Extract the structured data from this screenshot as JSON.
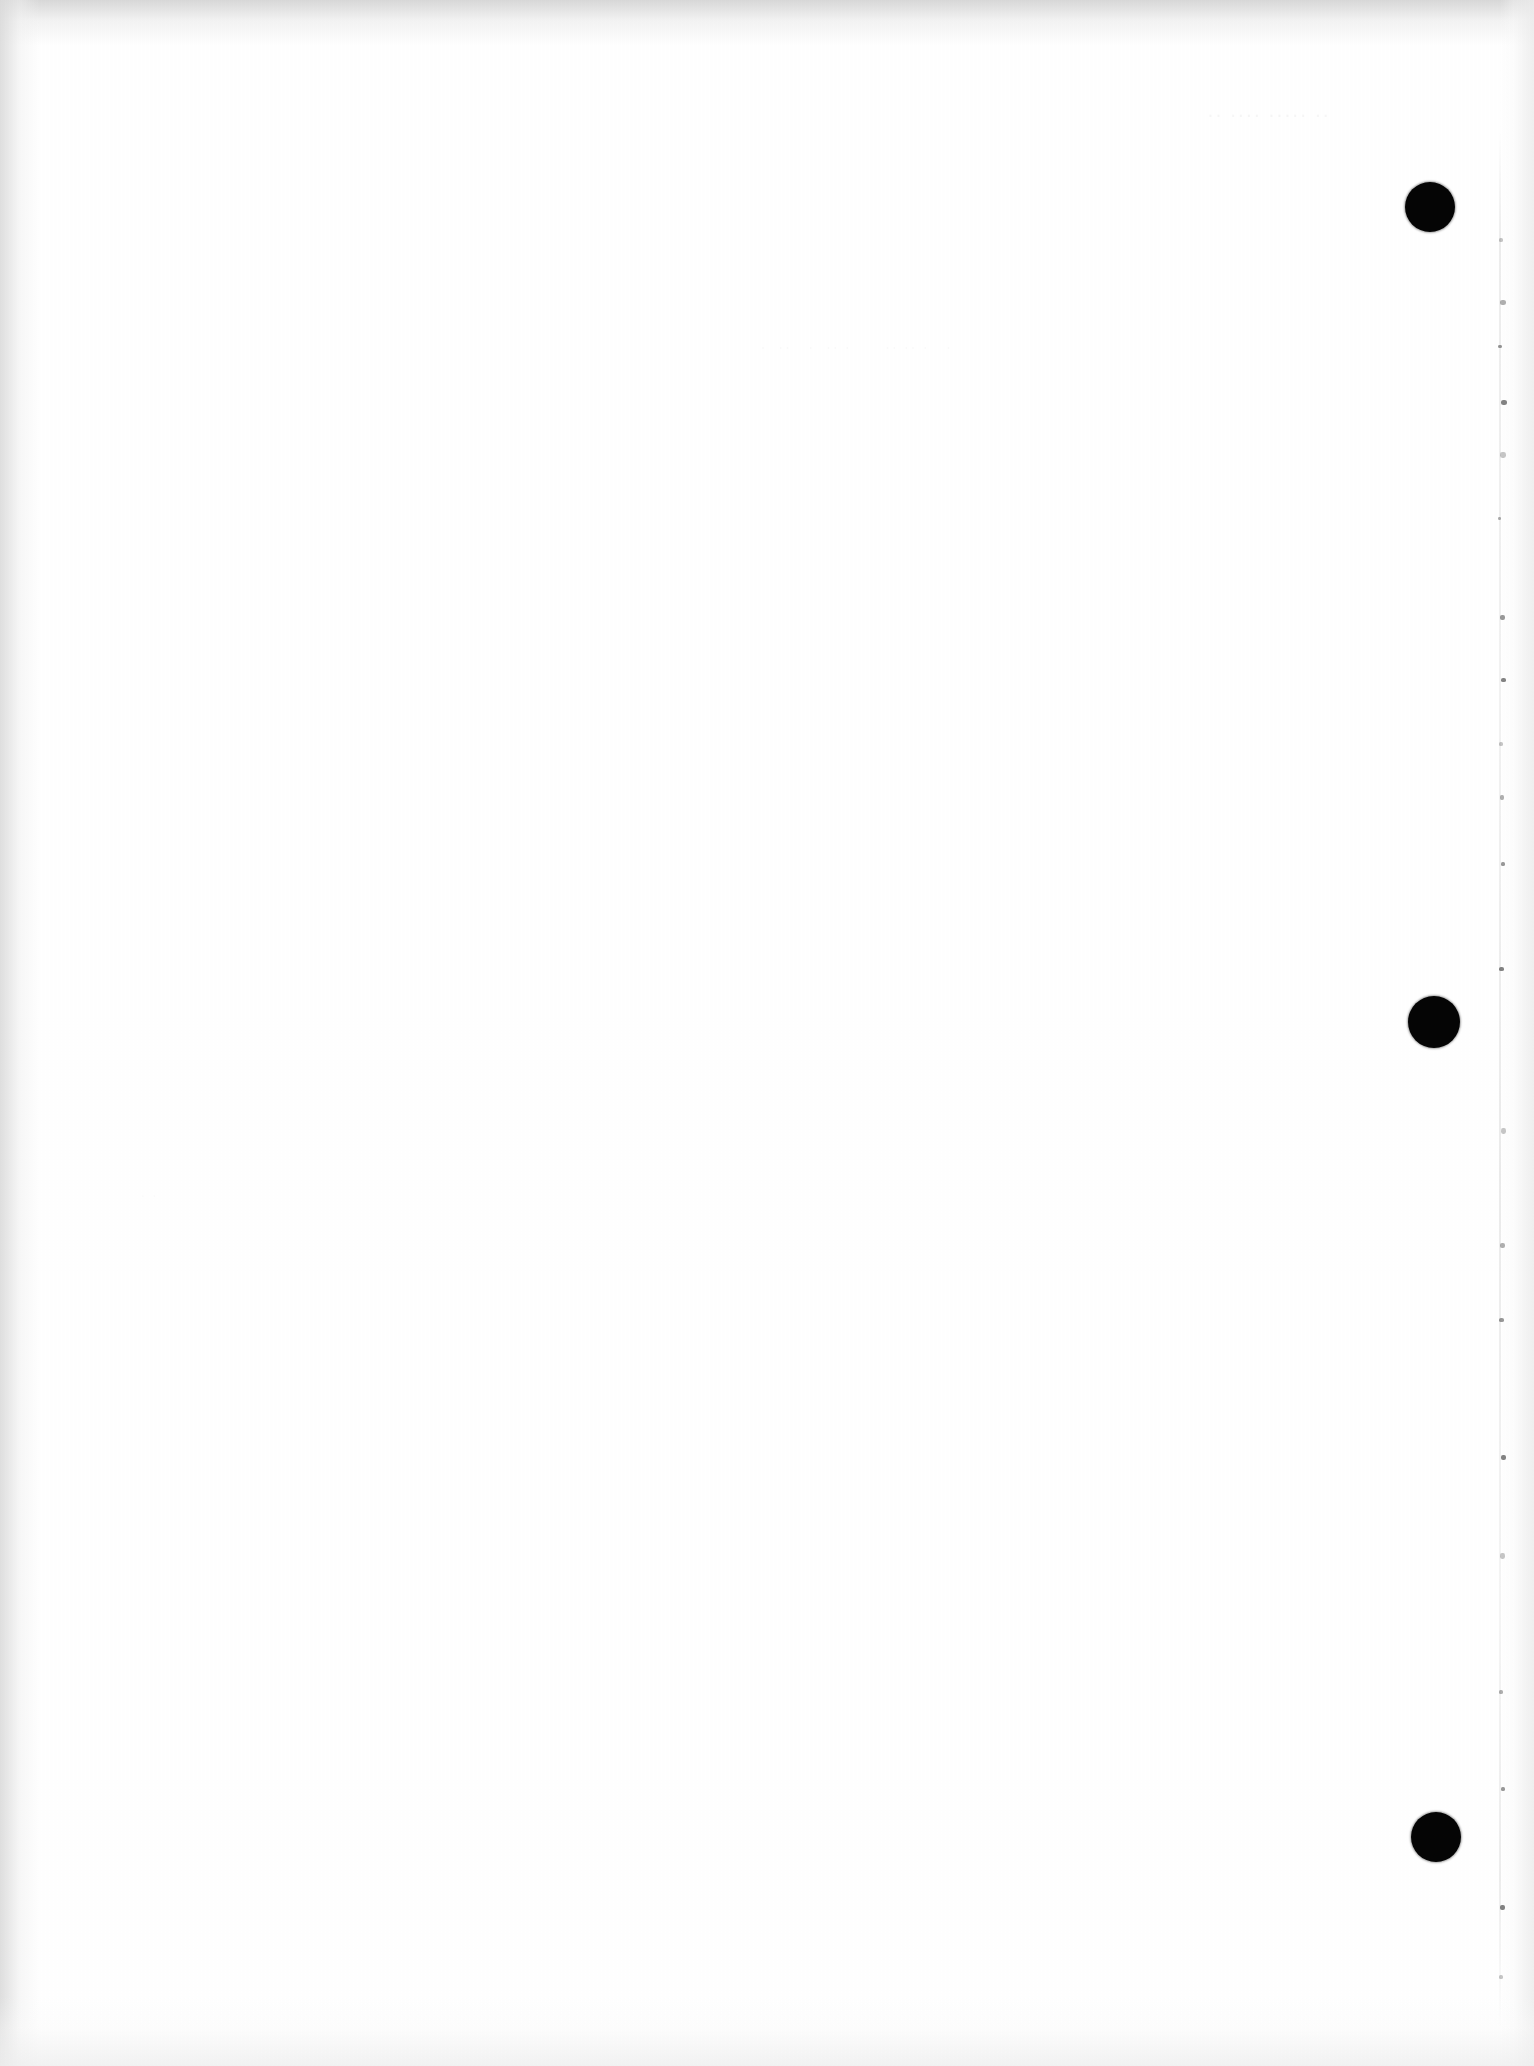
{
  "document": {
    "kind": "scanned-page",
    "orientation": "portrait",
    "page_state": "blank",
    "description": "Blank scanned document page with black registration punch marks along the right margin",
    "width_px": 1534,
    "height_px": 2066
  },
  "colors": {
    "page_background": "#ffffff",
    "scan_frame": "#171717",
    "punch_mark": "#050505",
    "edge_shade": "#ededed",
    "scan_line": "#5c5c5c",
    "ghost_text": "#000000"
  },
  "page": {
    "body_text": "",
    "visible_text": "",
    "note": "No legible printed text is present on this page."
  },
  "punch_marks": [
    {
      "id": "punch-mark-1",
      "label": "registration-dot-top",
      "x": 1430,
      "y": 207,
      "diameter": 50
    },
    {
      "id": "punch-mark-2",
      "label": "registration-dot-middle",
      "x": 1434,
      "y": 1022,
      "diameter": 52
    },
    {
      "id": "punch-mark-3",
      "label": "registration-dot-bottom",
      "x": 1436,
      "y": 1837,
      "diameter": 50
    }
  ],
  "scan_artifacts": {
    "vertical_line": {
      "label": "scanner-streak",
      "x": 1500,
      "top": 130,
      "bottom": 2030
    },
    "specks": [
      {
        "x": 1499,
        "y": 238,
        "w": 4,
        "h": 4
      },
      {
        "x": 1500,
        "y": 300,
        "w": 6,
        "h": 5
      },
      {
        "x": 1498,
        "y": 345,
        "w": 4,
        "h": 3
      },
      {
        "x": 1501,
        "y": 400,
        "w": 6,
        "h": 5
      },
      {
        "x": 1500,
        "y": 452,
        "w": 6,
        "h": 6
      },
      {
        "x": 1498,
        "y": 517,
        "w": 3,
        "h": 3
      },
      {
        "x": 1500,
        "y": 615,
        "w": 5,
        "h": 5
      },
      {
        "x": 1501,
        "y": 678,
        "w": 5,
        "h": 4
      },
      {
        "x": 1499,
        "y": 742,
        "w": 4,
        "h": 4
      },
      {
        "x": 1500,
        "y": 795,
        "w": 4,
        "h": 5
      },
      {
        "x": 1501,
        "y": 862,
        "w": 4,
        "h": 4
      },
      {
        "x": 1499,
        "y": 967,
        "w": 5,
        "h": 4
      },
      {
        "x": 1501,
        "y": 1128,
        "w": 5,
        "h": 6
      },
      {
        "x": 1500,
        "y": 1243,
        "w": 5,
        "h": 5
      },
      {
        "x": 1499,
        "y": 1318,
        "w": 5,
        "h": 4
      },
      {
        "x": 1501,
        "y": 1455,
        "w": 5,
        "h": 5
      },
      {
        "x": 1500,
        "y": 1553,
        "w": 5,
        "h": 6
      },
      {
        "x": 1499,
        "y": 1690,
        "w": 4,
        "h": 4
      },
      {
        "x": 1501,
        "y": 1787,
        "w": 4,
        "h": 4
      },
      {
        "x": 1500,
        "y": 1905,
        "w": 5,
        "h": 5
      },
      {
        "x": 1499,
        "y": 1975,
        "w": 4,
        "h": 4
      }
    ],
    "ghost_impressions": [
      {
        "id": "ghost-top-right",
        "label": "bleed-through-heading",
        "text": "·· ···· ····· ··",
        "legible": false
      },
      {
        "id": "ghost-mid-band",
        "label": "bleed-through-line",
        "text": "·  ··   ·  ·· ·      ·· ·· ·   ·",
        "legible": false
      },
      {
        "id": "ghost-lower",
        "label": "bleed-through-smudge",
        "text": "· ·",
        "legible": false
      }
    ]
  }
}
